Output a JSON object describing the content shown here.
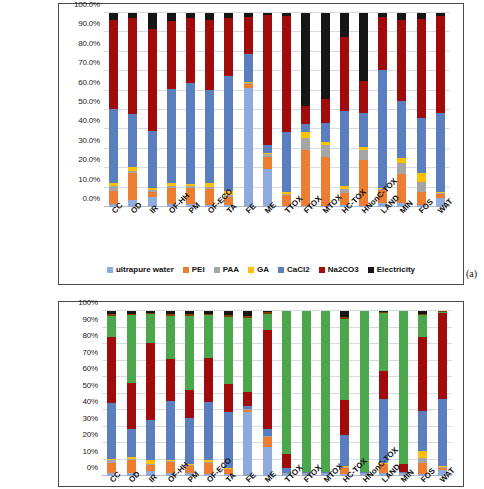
{
  "figure": {
    "panel_a_label": "(a)"
  },
  "chart_data": [
    {
      "id": "chart-a",
      "type": "bar",
      "stacked": true,
      "normalized": true,
      "title": "",
      "xlabel": "",
      "ylabel": "",
      "ylim": [
        0,
        100
      ],
      "grid": true,
      "legend_position": "bottom",
      "ytick_labels": [
        "0.0%",
        "10.0%",
        "20.0%",
        "30.0%",
        "40.0%",
        "50.0%",
        "60.0%",
        "70.0%",
        "80.0%",
        "90.0%",
        "100.0%"
      ],
      "ytick_values": [
        0,
        10,
        20,
        30,
        40,
        50,
        60,
        70,
        80,
        90,
        100
      ],
      "categories": [
        "CC",
        "OD",
        "IR",
        "OF-HH",
        "PM",
        "OF-ECO",
        "TA",
        "FE",
        "ME",
        "TTOX",
        "FTOX",
        "MTOX",
        "HC-TOX",
        "HNonC-TOX",
        "LAND",
        "MIN",
        "FOS",
        "WAT"
      ],
      "series": [
        {
          "name": "ultrapure water",
          "color": "#8FAADC",
          "values": [
            1.5,
            3.5,
            5.0,
            1.5,
            1.5,
            1.0,
            0.8,
            61.5,
            19.5,
            0.5,
            0.5,
            0.5,
            0.8,
            0.5,
            2.0,
            2.0,
            0.8,
            4.5
          ]
        },
        {
          "name": "PEI",
          "color": "#ED7D31",
          "values": [
            6.5,
            14.0,
            3.0,
            8.5,
            8.5,
            8.5,
            4.5,
            2.0,
            6.5,
            5.5,
            29.0,
            25.5,
            6.5,
            23.5,
            7.0,
            15.0,
            7.0,
            2.0
          ]
        },
        {
          "name": "PAA",
          "color": "#A5A5A5",
          "values": [
            3.0,
            1.0,
            1.0,
            1.0,
            1.0,
            1.0,
            1.0,
            0.5,
            1.5,
            0.5,
            6.0,
            6.0,
            2.0,
            5.5,
            0.5,
            5.5,
            5.0,
            0.5
          ]
        },
        {
          "name": "GA",
          "color": "#FFC000",
          "values": [
            1.5,
            2.0,
            1.0,
            1.5,
            1.0,
            2.0,
            2.0,
            0.5,
            0.5,
            1.0,
            3.0,
            1.5,
            1.5,
            1.5,
            0.5,
            3.0,
            5.0,
            1.0
          ]
        },
        {
          "name": "CaCl2",
          "color": "#5B7FBE",
          "values": [
            38.0,
            27.5,
            29.0,
            48.5,
            52.0,
            48.0,
            59.5,
            14.5,
            4.0,
            31.0,
            4.5,
            10.0,
            38.5,
            17.5,
            60.5,
            29.0,
            28.0,
            40.5
          ]
        },
        {
          "name": "Na2CO3",
          "color": "#A00B0B",
          "values": [
            46.0,
            49.5,
            53.0,
            35.0,
            33.5,
            36.0,
            29.5,
            19.0,
            67.0,
            60.0,
            9.0,
            12.0,
            38.5,
            16.5,
            27.5,
            42.0,
            51.0,
            50.0
          ]
        },
        {
          "name": "Electricity",
          "color": "#161616",
          "values": [
            3.5,
            2.5,
            8.0,
            4.0,
            2.5,
            3.5,
            2.7,
            2.0,
            1.0,
            1.5,
            48.0,
            44.5,
            12.2,
            35.0,
            2.0,
            3.5,
            3.2,
            1.5
          ]
        }
      ]
    },
    {
      "id": "chart-b",
      "type": "bar",
      "stacked": true,
      "normalized": true,
      "title": "",
      "xlabel": "",
      "ylabel": "",
      "ylim": [
        0,
        100
      ],
      "grid": true,
      "legend_position": "none",
      "ytick_labels": [
        "0%",
        "10%",
        "20%",
        "30%",
        "40%",
        "50%",
        "60%",
        "70%",
        "80%",
        "90%",
        "100%"
      ],
      "ytick_values": [
        0,
        10,
        20,
        30,
        40,
        50,
        60,
        70,
        80,
        90,
        100
      ],
      "categories": [
        "CC",
        "OD",
        "IR",
        "OF-HH",
        "PM",
        "OF-ECO",
        "TA",
        "FE",
        "ME",
        "TTOX",
        "FTOX",
        "MTOX",
        "HC-TOX",
        "HNonC-TOX",
        "LAND",
        "MIN",
        "FOS",
        "WAT"
      ],
      "series": [
        {
          "name": "ultrapure water",
          "color": "#8FAADC",
          "values": [
            2.0,
            2.0,
            3.0,
            2.0,
            2.0,
            1.5,
            1.0,
            39.0,
            17.5,
            1.0,
            1.0,
            1.0,
            1.5,
            1.0,
            2.0,
            1.0,
            1.0,
            3.5
          ]
        },
        {
          "name": "PEI",
          "color": "#ED7D31",
          "values": [
            6.0,
            8.0,
            3.5,
            6.5,
            4.0,
            6.5,
            3.0,
            1.0,
            6.0,
            0.5,
            0.5,
            0.5,
            3.5,
            0.5,
            5.0,
            0.5,
            7.0,
            1.5
          ]
        },
        {
          "name": "PAA",
          "color": "#A5A5A5",
          "values": [
            1.5,
            0.5,
            0.5,
            0.5,
            0.5,
            0.5,
            0.5,
            0.5,
            0.5,
            0.2,
            0.2,
            0.2,
            0.5,
            0.2,
            0.5,
            0.2,
            3.0,
            0.5
          ]
        },
        {
          "name": "GA",
          "color": "#FFC000",
          "values": [
            1.0,
            1.0,
            2.5,
            1.0,
            0.5,
            1.0,
            0.5,
            0.3,
            0.3,
            0.2,
            0.2,
            0.2,
            0.3,
            0.2,
            0.3,
            0.2,
            4.0,
            0.5
          ]
        },
        {
          "name": "CaCl2",
          "color": "#5B7FBE",
          "values": [
            34.0,
            17.0,
            24.5,
            35.5,
            28.0,
            35.5,
            34.0,
            1.5,
            4.0,
            3.0,
            0.3,
            0.3,
            19.0,
            0.3,
            39.0,
            0.3,
            24.5,
            41.0
          ]
        },
        {
          "name": "Na2CO3",
          "color": "#A00B0B",
          "values": [
            39.5,
            28.0,
            46.5,
            25.5,
            17.0,
            26.5,
            16.5,
            8.5,
            60.0,
            8.5,
            0.3,
            0.3,
            21.0,
            0.3,
            17.0,
            5.0,
            44.5,
            52.0
          ]
        },
        {
          "name": "Transport",
          "color": "#4CA64C",
          "values": [
            13.0,
            41.0,
            17.5,
            26.0,
            45.0,
            26.0,
            41.0,
            45.0,
            10.0,
            86.4,
            97.3,
            97.3,
            49.5,
            97.3,
            35.2,
            92.6,
            13.5,
            0.5
          ]
        },
        {
          "name": "Other",
          "color": "#7F3F00",
          "values": [
            1.0,
            1.0,
            1.0,
            1.0,
            1.0,
            1.0,
            1.0,
            1.0,
            1.0,
            0.1,
            0.1,
            0.1,
            1.0,
            0.1,
            0.5,
            0.1,
            1.0,
            0.3
          ]
        },
        {
          "name": "Electricity",
          "color": "#161616",
          "values": [
            2.0,
            1.5,
            1.0,
            2.0,
            2.0,
            1.5,
            2.5,
            3.2,
            0.7,
            0.1,
            0.1,
            0.1,
            3.7,
            0.1,
            0.5,
            0.1,
            1.5,
            0.2
          ]
        }
      ]
    }
  ]
}
